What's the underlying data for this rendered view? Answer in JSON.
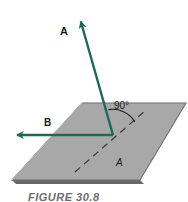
{
  "figure": {
    "caption": "FIGURE 30.8",
    "labels": {
      "vector_a": "A",
      "vector_b": "B",
      "angle": "90°",
      "plane": "A"
    },
    "colors": {
      "vector": "#1a6b55",
      "plane_fill": "#a8a8a8",
      "plane_edge": "#6f6f6f",
      "plane_shadow": "#4f4f4f",
      "dashed_line": "#3a3a3a",
      "text": "#1a1a1a",
      "caption": "#6d6d6d",
      "background": "#ffffff"
    },
    "geometry": {
      "origin": {
        "x": 113,
        "y": 135
      },
      "vector_a_tip": {
        "x": 79,
        "y": 15
      },
      "vector_b_tip": {
        "x": 10,
        "y": 135
      },
      "plane_corners": [
        {
          "x": 82,
          "y": 103
        },
        {
          "x": 186,
          "y": 103
        },
        {
          "x": 140,
          "y": 180
        },
        {
          "x": 12,
          "y": 180
        }
      ],
      "dashed_line_start": {
        "x": 75,
        "y": 172
      },
      "dashed_line_end": {
        "x": 146,
        "y": 110
      },
      "angle_arc_radius": 26
    }
  }
}
